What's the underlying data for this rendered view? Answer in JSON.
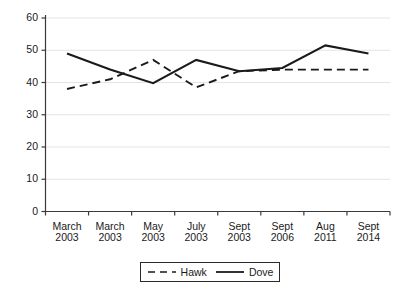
{
  "chart_data": {
    "type": "line",
    "title": "",
    "xlabel": "",
    "ylabel": "",
    "categories": [
      "March\n2003",
      "March\n2003",
      "May\n2003",
      "July\n2003",
      "Sept\n2003",
      "Sept\n2006",
      "Aug\n2011",
      "Sept\n2014"
    ],
    "series": [
      {
        "name": "Hawk",
        "style": "dashed",
        "color": "#1a1a1a",
        "values": [
          38,
          41,
          47,
          38.5,
          43.5,
          44,
          44,
          44
        ]
      },
      {
        "name": "Dove",
        "style": "solid",
        "color": "#1a1a1a",
        "values": [
          49,
          44,
          39.8,
          47,
          43.5,
          44.5,
          51.5,
          49
        ]
      }
    ],
    "ylim": [
      0,
      60
    ],
    "yticks": [
      0,
      10,
      20,
      30,
      40,
      50,
      60
    ],
    "ytick_labels": [
      "0",
      "10",
      "20",
      "30",
      "40",
      "50",
      "60"
    ],
    "grid": true,
    "grid_axis": "y",
    "legend_position": "bottom-center",
    "legend_entries": [
      "Hawk",
      "Dove"
    ]
  },
  "axes": {
    "y_axis_name": "y-axis",
    "x_axis_name": "x-axis"
  },
  "legend": {
    "hawk_label": "Hawk",
    "dove_label": "Dove"
  }
}
